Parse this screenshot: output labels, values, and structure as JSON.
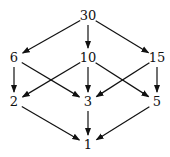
{
  "diagram": {
    "nodes": [
      {
        "id": "n30",
        "label": "30",
        "x": 88,
        "y": 20
      },
      {
        "id": "n6",
        "label": "6",
        "x": 14,
        "y": 62
      },
      {
        "id": "n10",
        "label": "10",
        "x": 88,
        "y": 62
      },
      {
        "id": "n15",
        "label": "15",
        "x": 157,
        "y": 62
      },
      {
        "id": "n2",
        "label": "2",
        "x": 14,
        "y": 106
      },
      {
        "id": "n3",
        "label": "3",
        "x": 88,
        "y": 106
      },
      {
        "id": "n5",
        "label": "5",
        "x": 157,
        "y": 106
      },
      {
        "id": "n1",
        "label": "1",
        "x": 88,
        "y": 149
      }
    ],
    "edges": [
      {
        "from": "n30",
        "to": "n6"
      },
      {
        "from": "n30",
        "to": "n10"
      },
      {
        "from": "n30",
        "to": "n15"
      },
      {
        "from": "n6",
        "to": "n2"
      },
      {
        "from": "n6",
        "to": "n3"
      },
      {
        "from": "n10",
        "to": "n2"
      },
      {
        "from": "n10",
        "to": "n3"
      },
      {
        "from": "n10",
        "to": "n5"
      },
      {
        "from": "n15",
        "to": "n3"
      },
      {
        "from": "n15",
        "to": "n5"
      },
      {
        "from": "n2",
        "to": "n1"
      },
      {
        "from": "n3",
        "to": "n1"
      },
      {
        "from": "n5",
        "to": "n1"
      }
    ]
  }
}
